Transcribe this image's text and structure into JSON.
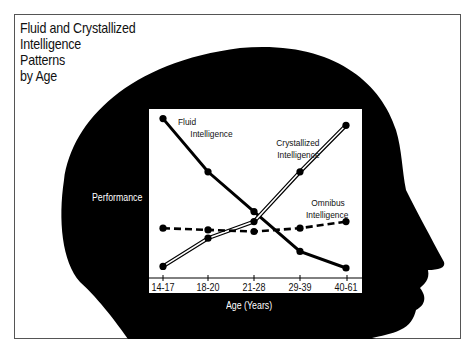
{
  "title": {
    "lines": [
      "Fluid and Crystallized",
      "Intelligence",
      "Patterns",
      "by Age"
    ]
  },
  "colors": {
    "silhouette": "#000000",
    "background": "#ffffff",
    "chart_panel": "#ffffff",
    "frame_border": "#555555"
  },
  "axes": {
    "y_label": "Performance",
    "x_label": "Age (Years)",
    "x_ticks": [
      "14-17",
      "18-20",
      "21-28",
      "29-39",
      "40-61"
    ]
  },
  "series_labels": {
    "fluid": [
      "Fluid",
      "Intelligence"
    ],
    "crystallized": [
      "Crystallized",
      "Intelligence"
    ],
    "omnibus": [
      "Omnibus",
      "Intelligence"
    ]
  },
  "chart_data": {
    "type": "line",
    "title": "Fluid and Crystallized Intelligence Patterns by Age",
    "xlabel": "Age (Years)",
    "ylabel": "Performance",
    "categories": [
      "14-17",
      "18-20",
      "21-28",
      "29-39",
      "40-61"
    ],
    "ylim": [
      0,
      100
    ],
    "grid": false,
    "y_ticks_shown": false,
    "legend": "inline labels near lines",
    "series": [
      {
        "name": "Fluid Intelligence",
        "style": "solid thick black",
        "values": [
          96,
          64,
          40,
          16,
          6
        ]
      },
      {
        "name": "Crystallized Intelligence",
        "style": "double outlined line",
        "values": [
          7,
          24,
          34,
          64,
          92
        ]
      },
      {
        "name": "Omnibus Intelligence",
        "style": "dashed black",
        "values": [
          30,
          29,
          28,
          30,
          34
        ]
      }
    ],
    "annotations": [
      "Chart is drawn inside the silhouette of a human head in profile facing right"
    ]
  }
}
